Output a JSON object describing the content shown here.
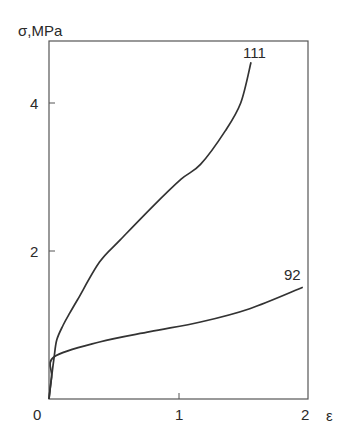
{
  "chart_data": {
    "type": "line",
    "title": "",
    "xlabel": "ε",
    "ylabel": "σ,MPa",
    "xlim": [
      0,
      2
    ],
    "ylim": [
      0,
      4.8
    ],
    "x_ticks": [
      "0",
      "1",
      "2"
    ],
    "y_ticks": [
      "2",
      "4"
    ],
    "grid": false,
    "legend": "none (curves labeled inline)",
    "series": [
      {
        "name": "111",
        "x": [
          0.0,
          0.02,
          0.04,
          0.06,
          0.11,
          0.16,
          0.22,
          0.39,
          0.55,
          0.8,
          1.02,
          1.17,
          1.36,
          1.48,
          1.56
        ],
        "y": [
          0.0,
          0.3,
          0.57,
          0.8,
          1.0,
          1.16,
          1.34,
          1.85,
          2.15,
          2.6,
          2.97,
          3.17,
          3.62,
          4.0,
          4.55
        ]
      },
      {
        "name": "92",
        "x": [
          0.0,
          0.02,
          0.04,
          0.39,
          0.78,
          1.17,
          1.55,
          1.96
        ],
        "y": [
          0.0,
          0.3,
          0.57,
          0.77,
          0.91,
          1.04,
          1.22,
          1.51
        ]
      }
    ],
    "annotations": [
      {
        "text": "111",
        "near": "end of upper curve"
      },
      {
        "text": "92",
        "near": "end of lower curve"
      }
    ]
  },
  "labels": {
    "y_axis": "σ,MPa",
    "x_axis": "ε",
    "tick_x0": "0",
    "tick_x1": "1",
    "tick_x2": "2",
    "tick_y2": "2",
    "tick_y4": "4",
    "curve_111": "111",
    "curve_92": "92"
  }
}
